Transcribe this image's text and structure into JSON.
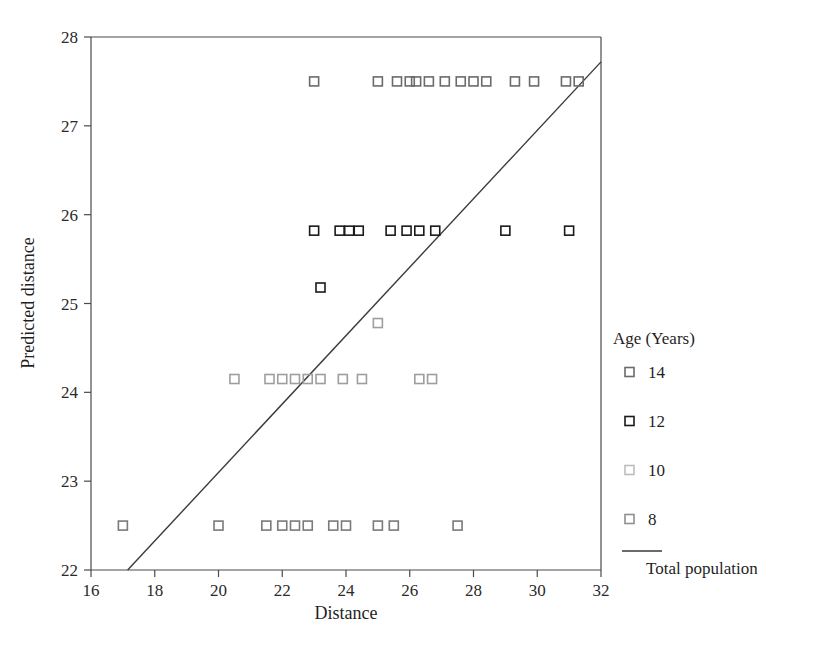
{
  "chart_data": {
    "type": "scatter",
    "title": "",
    "xlabel": "Distance",
    "ylabel": "Predicted distance",
    "xlim": [
      16,
      32
    ],
    "ylim": [
      22,
      28
    ],
    "xticks": [
      16,
      18,
      20,
      22,
      24,
      26,
      28,
      30,
      32
    ],
    "yticks": [
      22,
      23,
      24,
      25,
      26,
      27,
      28
    ],
    "grid": false,
    "legend_position": "right",
    "legend_title": "Age (Years)",
    "marker": "open-square",
    "series": [
      {
        "name": "14",
        "label": "14",
        "color": "#6b6b6b",
        "y_level": 27.5,
        "points": [
          [
            23.0,
            27.5
          ],
          [
            25.0,
            27.5
          ],
          [
            25.6,
            27.5
          ],
          [
            26.0,
            27.5
          ],
          [
            26.2,
            27.5
          ],
          [
            26.6,
            27.5
          ],
          [
            27.1,
            27.5
          ],
          [
            27.6,
            27.5
          ],
          [
            28.0,
            27.5
          ],
          [
            28.4,
            27.5
          ],
          [
            29.3,
            27.5
          ],
          [
            29.9,
            27.5
          ],
          [
            30.9,
            27.5
          ],
          [
            31.3,
            27.5
          ]
        ]
      },
      {
        "name": "12",
        "label": "12",
        "color": "#1a1a1a",
        "y_level": 25.82,
        "points": [
          [
            23.0,
            25.82
          ],
          [
            23.8,
            25.82
          ],
          [
            24.1,
            25.82
          ],
          [
            24.4,
            25.82
          ],
          [
            25.4,
            25.82
          ],
          [
            25.9,
            25.82
          ],
          [
            26.3,
            25.82
          ],
          [
            26.8,
            25.82
          ],
          [
            29.0,
            25.82
          ],
          [
            31.0,
            25.82
          ],
          [
            23.2,
            25.18
          ]
        ]
      },
      {
        "name": "10",
        "label": "10",
        "color": "#9e9e9e",
        "y_level": 24.15,
        "points": [
          [
            20.5,
            24.15
          ],
          [
            21.6,
            24.15
          ],
          [
            22.0,
            24.15
          ],
          [
            22.4,
            24.15
          ],
          [
            22.8,
            24.15
          ],
          [
            23.2,
            24.15
          ],
          [
            23.9,
            24.15
          ],
          [
            24.5,
            24.15
          ],
          [
            26.3,
            24.15
          ],
          [
            26.7,
            24.15
          ],
          [
            25.0,
            24.78
          ]
        ]
      },
      {
        "name": "8",
        "label": "8",
        "color": "#7a7a7a",
        "y_level": 22.5,
        "points": [
          [
            17.0,
            22.5
          ],
          [
            20.0,
            22.5
          ],
          [
            21.5,
            22.5
          ],
          [
            22.0,
            22.5
          ],
          [
            22.4,
            22.5
          ],
          [
            22.8,
            22.5
          ],
          [
            23.6,
            22.5
          ],
          [
            24.0,
            22.5
          ],
          [
            25.0,
            22.5
          ],
          [
            25.5,
            22.5
          ],
          [
            27.5,
            22.5
          ]
        ]
      }
    ],
    "reference_line": {
      "name": "Total population",
      "label": "Total population",
      "color": "#3a3a3a",
      "x0": 17.15,
      "y0": 22.0,
      "x1": 32.0,
      "y1": 27.72
    }
  },
  "axes": {
    "x_title": "Distance",
    "y_title": "Predicted distance",
    "x_tick_labels": [
      "16",
      "18",
      "20",
      "22",
      "24",
      "26",
      "28",
      "30",
      "32"
    ],
    "y_tick_labels": [
      "22",
      "23",
      "24",
      "25",
      "26",
      "27",
      "28"
    ]
  },
  "legend": {
    "title": "Age (Years)",
    "items": [
      {
        "label": "14",
        "color": "#6b6b6b",
        "marker": "open-square"
      },
      {
        "label": "12",
        "color": "#1a1a1a",
        "marker": "open-square"
      },
      {
        "label": "10",
        "color": "#bdbdbd",
        "marker": "open-square"
      },
      {
        "label": "8",
        "color": "#8f8f8f",
        "marker": "open-square"
      }
    ],
    "line_entry": {
      "label": "Total population",
      "color": "#3a3a3a",
      "marker": "line"
    }
  },
  "colors": {
    "frame": "#4a4a4a",
    "text": "#1f1f1f",
    "background": "#ffffff"
  }
}
